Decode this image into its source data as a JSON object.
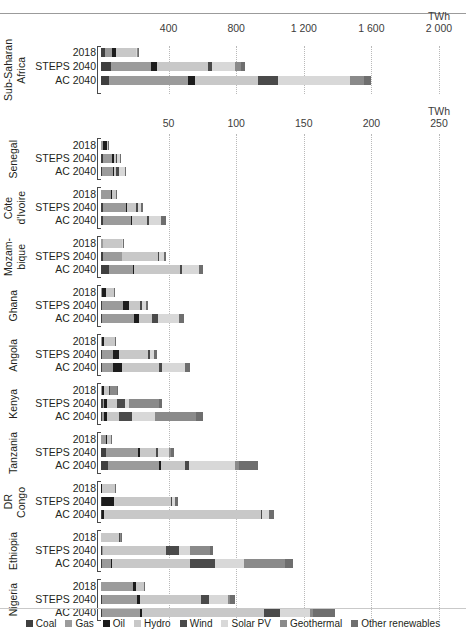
{
  "units": {
    "top": "TWh",
    "bottom": "TWh"
  },
  "legend": [
    {
      "label": "Coal",
      "key": "coal",
      "color": "#3f3f3f"
    },
    {
      "label": "Gas",
      "key": "gas",
      "color": "#9b9b9b"
    },
    {
      "label": "Oil",
      "key": "oil",
      "color": "#1c1c1c"
    },
    {
      "label": "Hydro",
      "key": "hydro",
      "color": "#c8c8c8"
    },
    {
      "label": "Wind",
      "key": "wind",
      "color": "#4a4a4a"
    },
    {
      "label": "Solar PV",
      "key": "solarpv",
      "color": "#d8d8d8"
    },
    {
      "label": "Geothermal",
      "key": "geothermal",
      "color": "#8a8a8a"
    },
    {
      "label": "Other renewables",
      "key": "otherren",
      "color": "#6e6e6e"
    }
  ],
  "scenarios": [
    "2018",
    "STEPS 2040",
    "AC 2040"
  ],
  "chart_data": [
    {
      "type": "bar",
      "title": "Sub-Saharan Africa",
      "orientation": "horizontal",
      "stacked": true,
      "xlabel": "TWh",
      "ylabel": "",
      "xlim": [
        0,
        2000
      ],
      "xticks": [
        0,
        400,
        800,
        1200,
        1600,
        2000
      ],
      "xticklabels": [
        "",
        "400",
        "800",
        "1 200",
        "1 600",
        "2 000"
      ],
      "grid": true,
      "legend_position": "bottom",
      "series": [
        "coal",
        "gas",
        "oil",
        "hydro",
        "wind",
        "solarpv",
        "geothermal",
        "otherren"
      ],
      "categories": [
        "2018",
        "STEPS 2040",
        "AC 2040"
      ],
      "values": [
        {
          "scenario": "2018",
          "coal": 26,
          "gas": 38,
          "oil": 24,
          "hydro": 118,
          "wind": 2,
          "solarpv": 3,
          "geothermal": 6,
          "otherren": 3
        },
        {
          "scenario": "STEPS 2040",
          "coal": 58,
          "gas": 236,
          "oil": 40,
          "hydro": 300,
          "wind": 22,
          "solarpv": 134,
          "geothermal": 36,
          "otherren": 24
        },
        {
          "scenario": "AC 2040",
          "coal": 46,
          "gas": 470,
          "oil": 40,
          "hydro": 372,
          "wind": 122,
          "solarpv": 424,
          "geothermal": 80,
          "otherren": 46
        }
      ]
    },
    {
      "type": "bar",
      "title": "Countries",
      "orientation": "horizontal",
      "stacked": true,
      "xlabel": "TWh",
      "ylabel": "",
      "xlim": [
        0,
        250
      ],
      "xticks": [
        0,
        50,
        100,
        150,
        200,
        250
      ],
      "xticklabels": [
        "",
        "50",
        "100",
        "150",
        "200",
        "250"
      ],
      "grid": true,
      "legend_position": "bottom",
      "series": [
        "coal",
        "gas",
        "oil",
        "hydro",
        "wind",
        "solarpv",
        "geothermal",
        "otherren"
      ],
      "groups": [
        {
          "country": "Senegal",
          "rows": [
            {
              "scenario": "2018",
              "coal": 0,
              "gas": 1.5,
              "oil": 3.0,
              "hydro": 0.6,
              "wind": 0,
              "solarpv": 0.4,
              "geothermal": 0,
              "otherren": 0.2
            },
            {
              "scenario": "STEPS 2040",
              "coal": 1.2,
              "gas": 6.6,
              "oil": 1.8,
              "hydro": 1.4,
              "wind": 1.0,
              "solarpv": 2.0,
              "geothermal": 0,
              "otherren": 0.6
            },
            {
              "scenario": "AC 2040",
              "coal": 0.6,
              "gas": 8.0,
              "oil": 1.2,
              "hydro": 1.6,
              "wind": 1.8,
              "solarpv": 4.4,
              "geothermal": 0,
              "otherren": 1.2
            }
          ]
        },
        {
          "country": "Côte\nd'Ivoire",
          "rows": [
            {
              "scenario": "2018",
              "coal": 0,
              "gas": 7.6,
              "oil": 0.4,
              "hydro": 2.8,
              "wind": 0,
              "solarpv": 0.2,
              "geothermal": 0,
              "otherren": 0.2
            },
            {
              "scenario": "STEPS 2040",
              "coal": 1.4,
              "gas": 17.0,
              "oil": 0.6,
              "hydro": 7.0,
              "wind": 1.2,
              "solarpv": 2.6,
              "geothermal": 0,
              "otherren": 1.0
            },
            {
              "scenario": "AC 2040",
              "coal": 1.2,
              "gas": 21.0,
              "oil": 0.6,
              "hydro": 11.0,
              "wind": 1.6,
              "solarpv": 9.0,
              "geothermal": 0,
              "otherren": 4.0
            }
          ]
        },
        {
          "country": "Mozam-\nbique",
          "rows": [
            {
              "scenario": "2018",
              "coal": 0,
              "gas": 1.4,
              "oil": 0.4,
              "hydro": 14.0,
              "wind": 0,
              "solarpv": 0.2,
              "geothermal": 0,
              "otherren": 0.2
            },
            {
              "scenario": "STEPS 2040",
              "coal": 1.6,
              "gas": 13.6,
              "oil": 0.6,
              "hydro": 26.0,
              "wind": 0.8,
              "solarpv": 4.0,
              "geothermal": 0,
              "otherren": 1.4
            },
            {
              "scenario": "AC 2040",
              "coal": 6.0,
              "gas": 18.0,
              "oil": 0.6,
              "hydro": 34.0,
              "wind": 1.6,
              "solarpv": 12.0,
              "geothermal": 0,
              "otherren": 3.2
            }
          ]
        },
        {
          "country": "Ghana",
          "rows": [
            {
              "scenario": "2018",
              "coal": 0,
              "gas": 1.0,
              "oil": 2.4,
              "hydro": 6.2,
              "wind": 0,
              "solarpv": 0.2,
              "geothermal": 0,
              "otherren": 0.2
            },
            {
              "scenario": "STEPS 2040",
              "coal": 0.6,
              "gas": 16.0,
              "oil": 4.2,
              "hydro": 8.0,
              "wind": 1.6,
              "solarpv": 3.0,
              "geothermal": 0,
              "otherren": 1.6
            },
            {
              "scenario": "AC 2040",
              "coal": 0.6,
              "gas": 24.0,
              "oil": 3.6,
              "hydro": 9.6,
              "wind": 4.0,
              "solarpv": 16.0,
              "geothermal": 0,
              "otherren": 3.6
            }
          ]
        },
        {
          "country": "Angola",
          "rows": [
            {
              "scenario": "2018",
              "coal": 0,
              "gas": 0.6,
              "oil": 1.6,
              "hydro": 8.0,
              "wind": 0,
              "solarpv": 0.2,
              "geothermal": 0,
              "otherren": 0.2
            },
            {
              "scenario": "STEPS 2040",
              "coal": 0.6,
              "gas": 8.0,
              "oil": 4.4,
              "hydro": 22.0,
              "wind": 1.4,
              "solarpv": 3.0,
              "geothermal": 0,
              "otherren": 2.0
            },
            {
              "scenario": "AC 2040",
              "coal": 0.6,
              "gas": 8.6,
              "oil": 6.6,
              "hydro": 27.0,
              "wind": 2.6,
              "solarpv": 17.0,
              "geothermal": 0,
              "otherren": 3.6
            }
          ]
        },
        {
          "country": "Kenya",
          "rows": [
            {
              "scenario": "2018",
              "coal": 0,
              "gas": 0.4,
              "oil": 1.6,
              "hydro": 4.0,
              "wind": 0.6,
              "solarpv": 0.2,
              "geothermal": 5.2,
              "otherren": 0.4
            },
            {
              "scenario": "STEPS 2040",
              "coal": 1.2,
              "gas": 1.0,
              "oil": 2.6,
              "hydro": 7.0,
              "wind": 5.6,
              "solarpv": 3.6,
              "geothermal": 22.0,
              "otherren": 2.4
            },
            {
              "scenario": "AC 2040",
              "coal": 1.0,
              "gas": 1.2,
              "oil": 2.0,
              "hydro": 9.4,
              "wind": 9.0,
              "solarpv": 17.0,
              "geothermal": 31.0,
              "otherren": 5.0
            }
          ]
        },
        {
          "country": "Tanzania",
          "rows": [
            {
              "scenario": "2018",
              "coal": 0,
              "gas": 3.6,
              "oil": 1.2,
              "hydro": 2.6,
              "wind": 0,
              "solarpv": 0.2,
              "geothermal": 0,
              "otherren": 0.4
            },
            {
              "scenario": "STEPS 2040",
              "coal": 3.6,
              "gas": 24.0,
              "oil": 1.2,
              "hydro": 12.0,
              "wind": 1.4,
              "solarpv": 8.0,
              "geothermal": 1.4,
              "otherren": 2.4
            },
            {
              "scenario": "AC 2040",
              "coal": 5.0,
              "gas": 38.0,
              "oil": 1.2,
              "hydro": 18.0,
              "wind": 2.6,
              "solarpv": 34.0,
              "geothermal": 3.0,
              "otherren": 14.0
            }
          ]
        },
        {
          "country": "DR\nCongo",
          "rows": [
            {
              "scenario": "2018",
              "coal": 0,
              "gas": 0,
              "oil": 0.4,
              "hydro": 10.0,
              "wind": 0,
              "solarpv": 0.2,
              "geothermal": 0,
              "otherren": 0.2
            },
            {
              "scenario": "STEPS 2040",
              "coal": 0.4,
              "gas": 0.2,
              "oil": 9.0,
              "hydro": 42.0,
              "wind": 0.6,
              "solarpv": 2.6,
              "geothermal": 0,
              "otherren": 1.8
            },
            {
              "scenario": "AC 2040",
              "coal": 0.4,
              "gas": 0.4,
              "oil": 1.2,
              "hydro": 116.0,
              "wind": 1.4,
              "solarpv": 5.0,
              "geothermal": 0,
              "otherren": 3.6
            }
          ]
        },
        {
          "country": "Ethiopia",
          "rows": [
            {
              "scenario": "2018",
              "coal": 0,
              "gas": 0,
              "oil": 0.2,
              "hydro": 13.0,
              "wind": 1.0,
              "solarpv": 0.2,
              "geothermal": 0.4,
              "otherren": 0.4
            },
            {
              "scenario": "STEPS 2040",
              "coal": 0.8,
              "gas": 0.4,
              "oil": 0.6,
              "hydro": 46.0,
              "wind": 10.0,
              "solarpv": 8.0,
              "geothermal": 15.0,
              "otherren": 2.2
            },
            {
              "scenario": "AC 2040",
              "coal": 0.4,
              "gas": 7.0,
              "oil": 0.6,
              "hydro": 58.0,
              "wind": 18.0,
              "solarpv": 22.0,
              "geothermal": 30.0,
              "otherren": 6.0
            }
          ]
        },
        {
          "country": "Nigeria",
          "rows": [
            {
              "scenario": "2018",
              "coal": 0,
              "gas": 24.0,
              "oil": 1.6,
              "hydro": 6.0,
              "wind": 0,
              "solarpv": 0.2,
              "geothermal": 0,
              "otherren": 0.2
            },
            {
              "scenario": "STEPS 2040",
              "coal": 0.8,
              "gas": 26.0,
              "oil": 2.0,
              "hydro": 45.0,
              "wind": 6.0,
              "solarpv": 14.0,
              "geothermal": 1.4,
              "otherren": 3.6
            },
            {
              "scenario": "AC 2040",
              "coal": 0.6,
              "gas": 28.0,
              "oil": 2.0,
              "hydro": 90.0,
              "wind": 12.0,
              "solarpv": 22.0,
              "geothermal": 2.4,
              "otherren": 16.0
            }
          ]
        }
      ]
    }
  ]
}
